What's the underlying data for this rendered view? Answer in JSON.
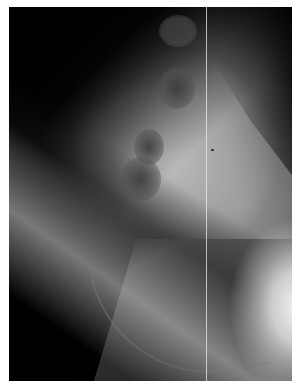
{
  "image": {
    "kind": "radiograph",
    "modality": "x-ray",
    "color_mode": "grayscale",
    "background_color": "#ffffff",
    "film_color_dark": "#050505",
    "film_color_bright": "#f0f0f0"
  },
  "annotations": {
    "visible_text": []
  }
}
